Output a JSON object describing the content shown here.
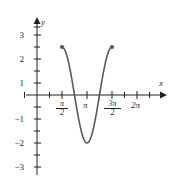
{
  "figure": {
    "kind": "math-graph",
    "background": "#ffffff",
    "stroke_color": "#58595b",
    "axis_color": "#231f20"
  },
  "axes": {
    "x_axis_label": "x",
    "y_axis_label": "y",
    "x_ticks": [
      {
        "value": 1.5707963,
        "label_parts": {
          "num": "π",
          "den": "2"
        },
        "type": "fraction"
      },
      {
        "value": 3.1415927,
        "label": "π",
        "type": "plain"
      },
      {
        "value": 4.712389,
        "label_parts": {
          "num": "3π",
          "den": "2"
        },
        "type": "fraction"
      },
      {
        "value": 6.2831853,
        "label": "2π",
        "type": "plain"
      }
    ],
    "y_ticks": [
      {
        "value": 3,
        "label": "3"
      },
      {
        "value": 2,
        "label": "2"
      },
      {
        "value": 1,
        "label": "1"
      },
      {
        "value": -1,
        "label": "−1"
      },
      {
        "value": -2,
        "label": "−2"
      },
      {
        "value": -3,
        "label": "−3"
      }
    ],
    "minor_tick_step_x": 0.7853982,
    "minor_tick_step_y": 0.5,
    "xlim": [
      -0.6,
      7.6
    ],
    "ylim": [
      -3.6,
      3.6
    ]
  },
  "chart_data": {
    "type": "line",
    "title": "",
    "xlabel": "x",
    "ylabel": "y",
    "grid": false,
    "legend": null,
    "xlim": [
      -0.6,
      7.6
    ],
    "ylim": [
      -3.6,
      3.6
    ],
    "x_tick_labels": [
      "π/2",
      "π",
      "3π/2",
      "2π"
    ],
    "x_tick_values": [
      1.5707963,
      3.1415927,
      4.712389,
      6.2831853
    ],
    "y_tick_labels": [
      "3",
      "2",
      "1",
      "−1",
      "−2",
      "−3"
    ],
    "y_tick_values": [
      3,
      2,
      1,
      -1,
      -2,
      -3
    ],
    "series": [
      {
        "name": "y = −2cos(2x)",
        "expression": "-2*cos(2*x)",
        "domain": [
          1.5707963,
          4.712389
        ],
        "color": "#58595b",
        "line_width": 1.6,
        "x": [
          1.5708,
          1.7453,
          1.9199,
          2.0944,
          2.2689,
          2.4435,
          2.618,
          2.7925,
          2.9671,
          3.1416,
          3.3161,
          3.4907,
          3.6652,
          3.8397,
          4.0143,
          4.1888,
          4.3633,
          4.5379,
          4.7124
        ],
        "y": [
          2.0,
          1.879,
          1.532,
          1.0,
          0.347,
          -0.347,
          -1.0,
          -1.532,
          -1.879,
          -2.0,
          -1.879,
          -1.532,
          -1.0,
          -0.347,
          0.347,
          1.0,
          1.532,
          1.879,
          2.0
        ]
      }
    ],
    "endpoints": [
      {
        "x": 1.5707963,
        "y": 2,
        "style": "filled-dot",
        "label": "left-endpoint"
      },
      {
        "x": 4.712389,
        "y": 2,
        "style": "filled-dot",
        "label": "right-endpoint"
      }
    ],
    "annotations": [
      {
        "text": "minimum at (π, −2)",
        "x": 3.1415927,
        "y": -2
      }
    ]
  }
}
